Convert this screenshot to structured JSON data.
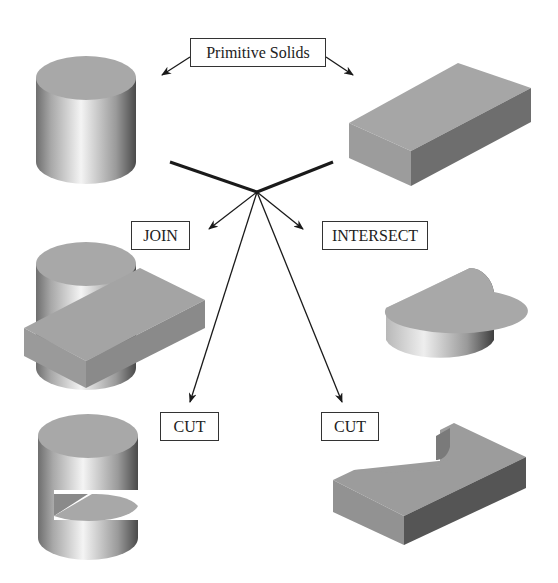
{
  "labels": {
    "primitive": "Primitive Solids",
    "join": "JOIN",
    "intersect": "INTERSECT",
    "cut_left": "CUT",
    "cut_right": "CUT"
  },
  "colors": {
    "line": "#1a1a1a",
    "face_top": "#a6a6a6",
    "face_side_light": "#b0b0b0",
    "face_side_dark": "#6a6a6a"
  },
  "shapes": [
    "cylinder",
    "box",
    "join-result",
    "intersect-result",
    "cut-cylinder",
    "cut-box"
  ]
}
